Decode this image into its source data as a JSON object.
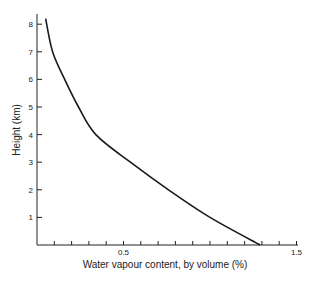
{
  "chart_data": {
    "type": "line",
    "title": "",
    "xlabel": "Water vapour content, by volume (%)",
    "ylabel": "Height (km)",
    "xlim": [
      0,
      1.5
    ],
    "ylim": [
      0,
      8.2
    ],
    "x_ticks": [
      0.1,
      0.2,
      0.3,
      0.4,
      0.5,
      0.6,
      0.7,
      0.8,
      0.9,
      1.0,
      1.1,
      1.2,
      1.3,
      1.4,
      1.5
    ],
    "x_tick_labels": [
      {
        "value": 0.5,
        "label": "0.5"
      },
      {
        "value": 1.5,
        "label": "1.5"
      }
    ],
    "y_ticks": [
      1,
      2,
      3,
      4,
      5,
      6,
      7,
      8
    ],
    "y_tick_labels": [
      "1",
      "2",
      "3",
      "4",
      "5",
      "6",
      "7",
      "8"
    ],
    "grid": false,
    "legend": null,
    "series": [
      {
        "name": "Water vapour content",
        "color": "#1a1a1a",
        "points": [
          {
            "x": 1.29,
            "y": 0.0
          },
          {
            "x": 1.0,
            "y": 1.0
          },
          {
            "x": 0.76,
            "y": 2.0
          },
          {
            "x": 0.54,
            "y": 3.0
          },
          {
            "x": 0.34,
            "y": 4.0
          },
          {
            "x": 0.24,
            "y": 5.0
          },
          {
            "x": 0.16,
            "y": 6.0
          },
          {
            "x": 0.09,
            "y": 7.0
          },
          {
            "x": 0.05,
            "y": 8.2
          }
        ]
      }
    ]
  }
}
